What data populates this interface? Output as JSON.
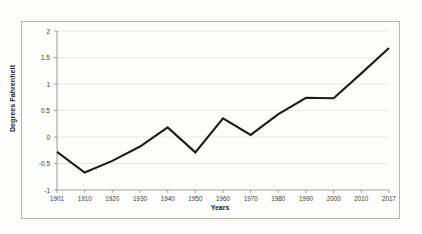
{
  "chart_data": {
    "type": "line",
    "title": "",
    "xlabel": "Years",
    "ylabel": "Degrees Fahrenheit",
    "xlim": [
      1901,
      2017
    ],
    "ylim": [
      -1,
      2
    ],
    "grid": true,
    "legend": "none",
    "x": [
      1901,
      1910,
      1920,
      1930,
      1940,
      1950,
      1960,
      1970,
      1980,
      1990,
      2000,
      2010,
      2017
    ],
    "values": [
      -0.28,
      -0.67,
      -0.45,
      -0.18,
      0.18,
      -0.29,
      0.35,
      0.04,
      0.43,
      0.74,
      0.73,
      1.2,
      1.68
    ],
    "xticks": [
      "1901",
      "1910",
      "1920",
      "1930",
      "1940",
      "1950",
      "1960",
      "1970",
      "1980",
      "1990",
      "2000",
      "2010",
      "2017"
    ],
    "yticks": [
      "2",
      "1.5",
      "1",
      "0.5",
      "0",
      "-0.5",
      "-1"
    ],
    "ytick_values": [
      2,
      1.5,
      1,
      0.5,
      0,
      -0.5,
      -1
    ],
    "line_color": "#1c1c18",
    "grid_color": "#e7e5de",
    "axis_color": "#8e8c82",
    "plot_background": "#fdfdfb"
  }
}
